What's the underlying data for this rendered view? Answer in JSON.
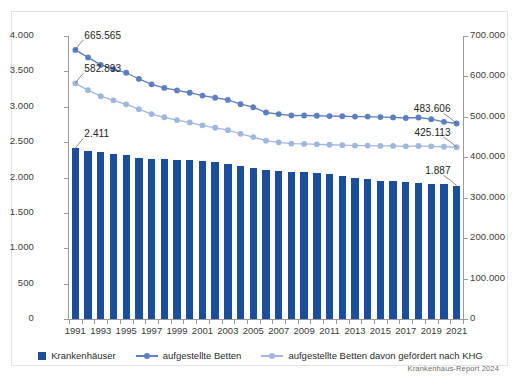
{
  "chart_data": {
    "type": "bar",
    "title": "",
    "subtitle": "",
    "xlabel": "",
    "ylabel": "",
    "grid": false,
    "legend_position": "bottom",
    "source": "Krankenhaus-Report 2024",
    "x": [
      1991,
      1992,
      1993,
      1994,
      1995,
      1996,
      1997,
      1998,
      1999,
      2000,
      2001,
      2002,
      2003,
      2004,
      2005,
      2006,
      2007,
      2008,
      2009,
      2010,
      2011,
      2012,
      2013,
      2014,
      2015,
      2016,
      2017,
      2018,
      2019,
      2020,
      2021
    ],
    "tick_labels_x": [
      "1991",
      "1993",
      "1995",
      "1997",
      "1999",
      "2001",
      "2003",
      "2005",
      "2007",
      "2009",
      "2011",
      "2013",
      "2015",
      "2017",
      "2019",
      "2021"
    ],
    "axes": {
      "left": {
        "label": "",
        "min": 0,
        "max": 4000,
        "step": 500,
        "ticks": [
          "0",
          "500",
          "1.000",
          "1.500",
          "2.000",
          "2.500",
          "3.000",
          "3.500",
          "4.000"
        ]
      },
      "right": {
        "label": "",
        "min": 0,
        "max": 700000,
        "step": 100000,
        "ticks": [
          "0",
          "100.000",
          "200.000",
          "300.000",
          "400.000",
          "500.000",
          "600.000",
          "700.000"
        ]
      }
    },
    "series": [
      {
        "name": "Krankenhäuser",
        "type": "bar",
        "axis": "left",
        "color": "#1B4F9C",
        "values": [
          2411,
          2381,
          2354,
          2337,
          2325,
          2269,
          2258,
          2263,
          2252,
          2242,
          2240,
          2221,
          2197,
          2166,
          2139,
          2104,
          2087,
          2083,
          2084,
          2064,
          2045,
          2017,
          1996,
          1980,
          1956,
          1951,
          1942,
          1925,
          1914,
          1903,
          1887
        ]
      },
      {
        "name": "aufgestellte Betten",
        "type": "line",
        "axis": "right",
        "color": "#5B7FBF",
        "values": [
          665565,
          646995,
          628658,
          618176,
          609123,
          593743,
          580425,
          571629,
          565268,
          559651,
          552680,
          547284,
          541901,
          531333,
          523824,
          510767,
          506954,
          503360,
          503341,
          502749,
          502029,
          501475,
          500671,
          500680,
          499351,
          498718,
          497182,
          498352,
          494326,
          487783,
          483606
        ]
      },
      {
        "name": "aufgestellte Betten davon gefördert nach KHG",
        "type": "line",
        "axis": "right",
        "color": "#9FB7DD",
        "values": [
          582893,
          566000,
          551000,
          541000,
          531000,
          519000,
          507000,
          499000,
          492000,
          486000,
          479000,
          473000,
          467000,
          458000,
          450000,
          441000,
          437000,
          434000,
          433000,
          432000,
          431000,
          430000,
          429000,
          429000,
          428000,
          428000,
          427000,
          428000,
          427000,
          426000,
          425113
        ]
      }
    ],
    "annotations": [
      {
        "text": "665.565",
        "series": "aufgestellte Betten",
        "point": 1991
      },
      {
        "text": "582.893",
        "series": "aufgestellte Betten davon gefördert nach KHG",
        "point": 1991
      },
      {
        "text": "2.411",
        "series": "Krankenhäuser",
        "point": 1991
      },
      {
        "text": "483.606",
        "series": "aufgestellte Betten",
        "point": 2021
      },
      {
        "text": "425.113",
        "series": "aufgestellte Betten davon gefördert nach KHG",
        "point": 2021
      },
      {
        "text": "1.887",
        "series": "Krankenhäuser",
        "point": 2021
      }
    ]
  }
}
